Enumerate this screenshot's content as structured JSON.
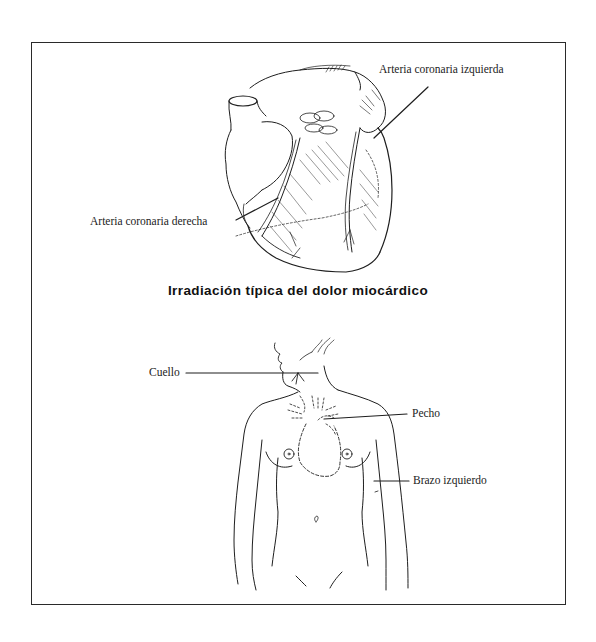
{
  "figure": {
    "title": "Irradiación típica del dolor miocárdico",
    "heart_illustration": {
      "labels": {
        "left_coronary": "Arteria coronaria izquierda",
        "right_coronary": "Arteria coronaria derecha"
      }
    },
    "body_illustration": {
      "labels": {
        "neck": "Cuello",
        "chest": "Pecho",
        "left_arm": "Brazo izquierdo"
      }
    }
  },
  "colors": {
    "ink": "#1e1e1e",
    "background": "#ffffff",
    "frame": "#2a2a2a"
  }
}
